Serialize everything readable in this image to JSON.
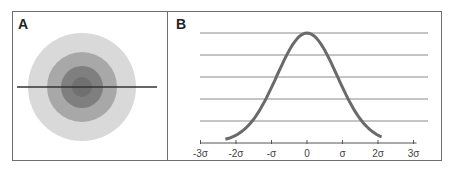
{
  "panels": {
    "a": {
      "label": "A",
      "rings": [
        {
          "r": 54,
          "color": "#d9d9d9"
        },
        {
          "r": 35,
          "color": "#a8a8a8"
        },
        {
          "r": 21,
          "color": "#7f7f7f"
        },
        {
          "r": 10,
          "color": "#707070"
        }
      ],
      "center": [
        82,
        87
      ],
      "line_color": "#333333"
    },
    "b": {
      "label": "B",
      "curve_color": "#6a6a6a",
      "gridline_color": "#8a8a8a"
    }
  },
  "chart_data": {
    "type": "line",
    "title": "",
    "xlabel": "",
    "ylabel": "",
    "x_tick_labels": [
      "-3σ",
      "-2σ",
      "-σ",
      "0",
      "σ",
      "2σ",
      "3σ"
    ],
    "x_ticks": [
      -3,
      -2,
      -1,
      0,
      1,
      2,
      3
    ],
    "grid": "horizontal lines (5)",
    "series": [
      {
        "name": "normal distribution",
        "function": "exp(-x^2/2)",
        "x_range": [
          -2.3,
          2.1
        ]
      }
    ]
  }
}
